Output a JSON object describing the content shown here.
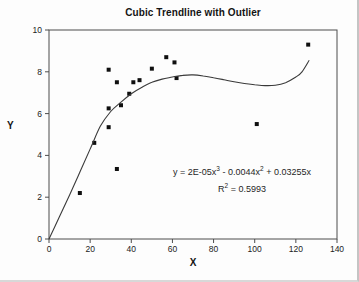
{
  "chart_data": {
    "type": "scatter",
    "title": "Cubic Trendline with Outlier",
    "xlabel": "X",
    "ylabel": "Y",
    "xlim": [
      0,
      140
    ],
    "ylim": [
      0,
      10
    ],
    "x_ticks": [
      0,
      20,
      40,
      60,
      80,
      100,
      120,
      140
    ],
    "y_ticks": [
      0,
      2,
      4,
      6,
      8,
      10
    ],
    "grid": false,
    "legend": "none",
    "series": [
      {
        "name": "data-points",
        "kind": "scatter",
        "marker": "filled-square",
        "points": [
          [
            15,
            2.2
          ],
          [
            22,
            4.6
          ],
          [
            29,
            8.1
          ],
          [
            29,
            6.25
          ],
          [
            29,
            5.35
          ],
          [
            33,
            7.5
          ],
          [
            33,
            3.35
          ],
          [
            35,
            6.4
          ],
          [
            39,
            6.95
          ],
          [
            41,
            7.5
          ],
          [
            44,
            7.6
          ],
          [
            50,
            8.15
          ],
          [
            57,
            8.7
          ],
          [
            61,
            8.45
          ],
          [
            62,
            7.7
          ],
          [
            101,
            5.5
          ],
          [
            126,
            9.3
          ]
        ]
      },
      {
        "name": "cubic-trendline",
        "kind": "line",
        "style": "solid-thin",
        "points": [
          [
            0,
            0
          ],
          [
            5,
            1.05
          ],
          [
            10,
            2.1
          ],
          [
            15,
            3.2
          ],
          [
            20,
            4.3
          ],
          [
            25,
            5.4
          ],
          [
            30,
            6.1
          ],
          [
            35,
            6.55
          ],
          [
            40,
            6.95
          ],
          [
            45,
            7.25
          ],
          [
            50,
            7.5
          ],
          [
            55,
            7.65
          ],
          [
            60,
            7.75
          ],
          [
            65,
            7.83
          ],
          [
            70,
            7.85
          ],
          [
            75,
            7.8
          ],
          [
            80,
            7.72
          ],
          [
            85,
            7.62
          ],
          [
            90,
            7.52
          ],
          [
            95,
            7.44
          ],
          [
            100,
            7.38
          ],
          [
            105,
            7.34
          ],
          [
            110,
            7.36
          ],
          [
            115,
            7.48
          ],
          [
            120,
            7.75
          ],
          [
            123,
            8.0
          ],
          [
            126.5,
            8.55
          ]
        ]
      }
    ],
    "annotation": {
      "equation_plain": "y = 2E-05x^3 - 0.0044x^2 + 0.03255x",
      "r_squared_plain": "R^2 = 0.5993",
      "r_squared_value": 0.5993,
      "equation_parts": {
        "eq_p1": "y = 2E-05x",
        "eq_e1": "3",
        "eq_p2": " - 0.0044x",
        "eq_e2": "2",
        "eq_p3": " + 0.03255x",
        "r_p1": "R",
        "r_e1": "2",
        "r_p2": " = 0.5993"
      }
    },
    "colors": {
      "ink": "#222222",
      "marker": "#0f0f0f",
      "trendline": "#3a3a3a",
      "frame": "#4d4d4d"
    }
  }
}
